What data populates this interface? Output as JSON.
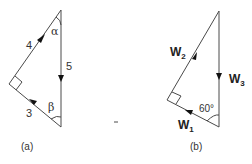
{
  "figure_a": {
    "caption": "(a)",
    "sides": {
      "hypotenuse_left_upper": "4",
      "vertical": "5",
      "lower_left": "3"
    },
    "angles": {
      "top": "α",
      "bottom": "β"
    },
    "right_angle": true
  },
  "figure_b": {
    "caption": "(b)",
    "vectors": [
      {
        "name": "W",
        "sub": "1"
      },
      {
        "name": "W",
        "sub": "2"
      },
      {
        "name": "W",
        "sub": "3"
      }
    ],
    "angle_label": "60°",
    "right_angle": true
  },
  "colors": {
    "line": "#4a4a4a",
    "arrow": "#111111",
    "text": "#333333"
  }
}
